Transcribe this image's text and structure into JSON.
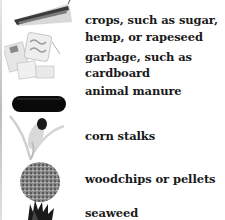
{
  "items": [
    {
      "icon": "sugarcane-knife-icon",
      "line1": "crops, such as sugar,",
      "line2": "hemp, or rapeseed"
    },
    {
      "icon": "cardboard-pieces-icon",
      "line1": "garbage, such as",
      "line2": "cardboard"
    },
    {
      "icon": "manure-icon",
      "line1": "animal manure"
    },
    {
      "icon": "corn-stalk-icon",
      "line1": "corn stalks"
    },
    {
      "icon": "woodchips-pile-icon",
      "line1": "woodchips or pellets"
    },
    {
      "icon": "seaweed-icon",
      "line1": "seaweed"
    }
  ]
}
